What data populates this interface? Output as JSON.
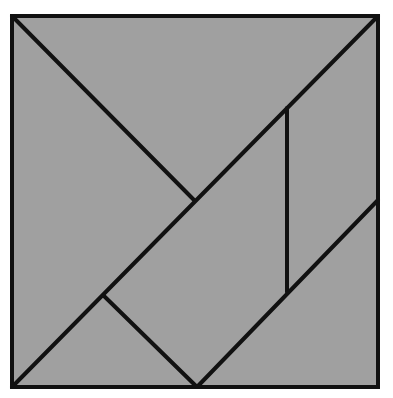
{
  "diagram": {
    "fill_color": "#a0a0a0",
    "stroke_color": "#111111",
    "background": "#ffffff",
    "stroke_width": 4,
    "square": {
      "x1": 12,
      "y1": 16,
      "x2": 378,
      "y2": 387
    },
    "pieces": [
      {
        "name": "large-triangle-top",
        "points": "12,16 378,16 194,200"
      },
      {
        "name": "large-triangle-left",
        "points": "12,16 194,200 104,296 12,387"
      },
      {
        "name": "small-triangle-bottom-left",
        "points": "12,387 104,296 197,387"
      },
      {
        "name": "square-piece",
        "points": "104,296 194,200 287,292 197,387"
      },
      {
        "name": "small-triangle-middle",
        "points": "194,200 287,108 287,292"
      },
      {
        "name": "parallelogram-right",
        "points": "287,108 378,16 378,200 287,292"
      },
      {
        "name": "medium-triangle-bottom-right",
        "points": "197,387 378,200 378,387"
      }
    ],
    "lines": [
      {
        "name": "diagonal-top-left-to-center",
        "x1": 12,
        "y1": 16,
        "x2": 194,
        "y2": 200
      },
      {
        "name": "diagonal-bottom-left-to-top-right",
        "x1": 12,
        "y1": 387,
        "x2": 378,
        "y2": 16
      },
      {
        "name": "square-left-edge",
        "x1": 104,
        "y1": 296,
        "x2": 197,
        "y2": 387
      },
      {
        "name": "vertical-divider",
        "x1": 287,
        "y1": 108,
        "x2": 287,
        "y2": 292
      },
      {
        "name": "diagonal-bottom-to-right",
        "x1": 197,
        "y1": 387,
        "x2": 378,
        "y2": 200
      }
    ]
  }
}
